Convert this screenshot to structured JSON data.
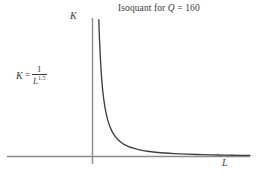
{
  "chart_data": {
    "type": "line",
    "title": "Isoquant for Q = 160",
    "title_prefix": "Isoquant for ",
    "title_var": "Q",
    "title_suffix": " = 160",
    "xlabel": "L",
    "ylabel": "K",
    "equation": {
      "lhs": "K",
      "equals": "=",
      "numerator": "1",
      "denominator_base": "L",
      "denominator_exponent": "1.5",
      "plain": "K = 1 / L^1.5"
    },
    "curve_label": "K = 1/L^1.5",
    "exponent": 1.5,
    "quantity": 160,
    "grid": false,
    "legend": false,
    "axis_arrows": false,
    "xlim": [
      0,
      10
    ],
    "ylim": [
      0,
      10
    ],
    "x": [
      0.4,
      0.45,
      0.5,
      0.55,
      0.6,
      0.65,
      0.7,
      0.8,
      0.9,
      1.0,
      1.15,
      1.3,
      1.5,
      1.75,
      2.0,
      2.3,
      2.6,
      3.0,
      3.5,
      4.0,
      4.6,
      5.2,
      6.0,
      7.0,
      8.0,
      9.0,
      10.0
    ],
    "y": [
      9.88,
      8.28,
      7.07,
      6.13,
      5.38,
      4.77,
      4.27,
      3.49,
      2.93,
      2.5,
      2.03,
      1.69,
      1.36,
      1.08,
      0.88,
      0.72,
      0.6,
      0.48,
      0.38,
      0.31,
      0.25,
      0.21,
      0.17,
      0.13,
      0.11,
      0.09,
      0.079
    ],
    "colors": {
      "curve": "#3f3f3f",
      "axis": "#8c8c8c",
      "text": "#3a3a3a",
      "background": "#ffffff"
    },
    "annotations": [
      {
        "name": "equation",
        "text": "K = 1/L^1.5",
        "position": "left-middle"
      },
      {
        "name": "title",
        "text": "Isoquant for Q = 160",
        "position": "top-center"
      }
    ]
  }
}
